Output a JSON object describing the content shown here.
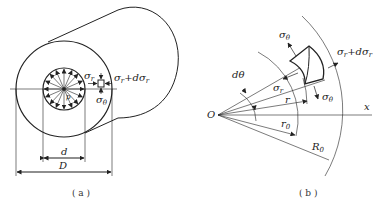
{
  "figure": {
    "panel_a": {
      "caption": "( a )",
      "labels": {
        "sigma_r": "σ",
        "sigma_r_sub": "r",
        "sigma_r_plus": "σ",
        "sigma_r_plus_sub": "r",
        "sigma_r_plus_mid": "+dσ",
        "sigma_theta": "σ",
        "sigma_theta_sub": "θ",
        "pressure": "p",
        "inner_diameter": "d",
        "outer_diameter": "D"
      }
    },
    "panel_b": {
      "caption": "( b )",
      "labels": {
        "origin": "O",
        "x_axis": "x",
        "dtheta": "dθ",
        "sigma_theta_top": "σ",
        "sigma_theta_top_sub": "θ",
        "sigma_r": "σ",
        "sigma_r_sub": "r",
        "sigma_r_plus": "σ",
        "sigma_r_plus_mid": "+dσ",
        "sigma_r_plus_sub": "r",
        "sigma_theta_bottom": "σ",
        "sigma_theta_bottom_sub": "θ",
        "r": "r",
        "r0": "r",
        "r0_sub": "0",
        "R0": "R",
        "R0_sub": "0"
      }
    },
    "colors": {
      "line": "#222222",
      "background": "#ffffff"
    }
  }
}
